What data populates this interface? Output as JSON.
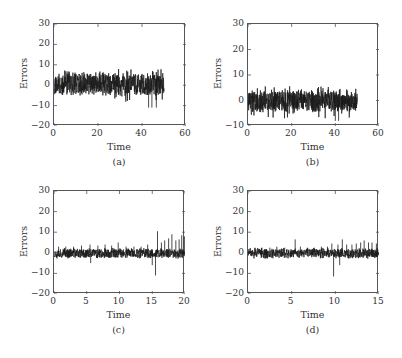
{
  "chart_data": [
    {
      "id": "a",
      "type": "line",
      "caption": "(a)",
      "xlabel": "Time",
      "ylabel": "Errors",
      "xlim": [
        0,
        60
      ],
      "ylim": [
        -20,
        30
      ],
      "xticks": [
        "0",
        "20",
        "40",
        "60"
      ],
      "yticks": [
        "30",
        "20",
        "10",
        "0",
        "−10",
        "−20"
      ],
      "data_range_x": [
        0,
        50
      ],
      "description": "Dense noise signal around 0, mostly between -5 and +7, occasional dips to about -11 near t=43-47",
      "envelope": {
        "upper": 7,
        "lower": -6,
        "min_spike": -11,
        "max_spike": 8
      },
      "seed": 11
    },
    {
      "id": "b",
      "type": "line",
      "caption": "(b)",
      "xlabel": "Time",
      "ylabel": "Errors",
      "xlim": [
        0,
        60
      ],
      "ylim": [
        -10,
        30
      ],
      "xticks": [
        "0",
        "20",
        "40",
        "60"
      ],
      "yticks": [
        "30",
        "20",
        "10",
        "0",
        "−10"
      ],
      "data_range_x": [
        0,
        50
      ],
      "description": "Dense noise signal around 0, mostly between -5 and +5, max about +6, min about -8",
      "envelope": {
        "upper": 5,
        "lower": -5,
        "min_spike": -8,
        "max_spike": 6
      },
      "seed": 23
    },
    {
      "id": "c",
      "type": "line",
      "caption": "(c)",
      "xlabel": "Time",
      "ylabel": "Errors",
      "xlim": [
        0,
        20
      ],
      "ylim": [
        -20,
        30
      ],
      "xticks": [
        "0",
        "5",
        "10",
        "15",
        "20"
      ],
      "yticks": [
        "30",
        "20",
        "10",
        "0",
        "−10",
        "−20"
      ],
      "data_range_x": [
        0,
        20
      ],
      "description": "Noise band about -3 to +3 with small periodic spikes; after t=15 larger spikes up to ~10 and a dip to ~-11 at t=15.5",
      "envelope": {
        "upper": 2.5,
        "lower": -3,
        "min_spike": -11,
        "max_spike": 10
      },
      "spikes": [
        {
          "x": 0.7,
          "y": 3
        },
        {
          "x": 1.8,
          "y": 3
        },
        {
          "x": 3.0,
          "y": 3
        },
        {
          "x": 4.2,
          "y": 3.5
        },
        {
          "x": 5.5,
          "y": 4
        },
        {
          "x": 5.6,
          "y": -5
        },
        {
          "x": 6.7,
          "y": 3.5
        },
        {
          "x": 7.8,
          "y": 4
        },
        {
          "x": 8.8,
          "y": 3.5
        },
        {
          "x": 9.8,
          "y": 5
        },
        {
          "x": 11,
          "y": 3
        },
        {
          "x": 12.2,
          "y": 3
        },
        {
          "x": 13.3,
          "y": 3
        },
        {
          "x": 14.3,
          "y": 4
        },
        {
          "x": 15.0,
          "y": -6
        },
        {
          "x": 15.5,
          "y": -11
        },
        {
          "x": 15.8,
          "y": 10.5
        },
        {
          "x": 16.4,
          "y": 5
        },
        {
          "x": 16.9,
          "y": 6
        },
        {
          "x": 17.5,
          "y": 7
        },
        {
          "x": 18.0,
          "y": 9
        },
        {
          "x": 18.6,
          "y": 6
        },
        {
          "x": 19.1,
          "y": 6.5
        },
        {
          "x": 19.5,
          "y": 8.5
        },
        {
          "x": 19.9,
          "y": 8
        }
      ],
      "seed": 37
    },
    {
      "id": "d",
      "type": "line",
      "caption": "(d)",
      "xlabel": "Time",
      "ylabel": "Errors",
      "xlim": [
        0,
        15
      ],
      "ylim": [
        -20,
        30
      ],
      "xticks": [
        "0",
        "5",
        "10",
        "15"
      ],
      "yticks": [
        "30",
        "20",
        "10",
        "0",
        "−10",
        "−20"
      ],
      "data_range_x": [
        0,
        15
      ],
      "description": "Noise band about -3 to +3 with regular small spikes; spike to ~6.5 at t=5.4, dip to ~-11.5 at t=9.8, growing spikes up to ~6 near t=13-15",
      "envelope": {
        "upper": 2.5,
        "lower": -3,
        "min_spike": -11.5,
        "max_spike": 6.5
      },
      "spikes": [
        {
          "x": 0.8,
          "y": 2.5
        },
        {
          "x": 1.6,
          "y": 2.5
        },
        {
          "x": 2.5,
          "y": 2.5
        },
        {
          "x": 3.3,
          "y": 3
        },
        {
          "x": 4.2,
          "y": 2.5
        },
        {
          "x": 5.4,
          "y": 6.5
        },
        {
          "x": 6.0,
          "y": 3
        },
        {
          "x": 6.8,
          "y": 2.5
        },
        {
          "x": 7.6,
          "y": 2.5
        },
        {
          "x": 8.4,
          "y": 3
        },
        {
          "x": 9.1,
          "y": 3
        },
        {
          "x": 9.6,
          "y": 4.5
        },
        {
          "x": 9.8,
          "y": -11.5
        },
        {
          "x": 10.3,
          "y": 4
        },
        {
          "x": 10.5,
          "y": -6
        },
        {
          "x": 10.8,
          "y": 6.5
        },
        {
          "x": 11.3,
          "y": 4
        },
        {
          "x": 11.9,
          "y": 4
        },
        {
          "x": 12.4,
          "y": 4.5
        },
        {
          "x": 12.9,
          "y": 5
        },
        {
          "x": 13.3,
          "y": 6
        },
        {
          "x": 13.8,
          "y": 5
        },
        {
          "x": 14.2,
          "y": 5
        },
        {
          "x": 14.7,
          "y": 4.5
        }
      ],
      "seed": 51
    }
  ],
  "panels": {
    "a": {
      "caption": "(a)",
      "xlabel": "Time",
      "ylabel": "Errors"
    },
    "b": {
      "caption": "(b)",
      "xlabel": "Time",
      "ylabel": "Errors"
    },
    "c": {
      "caption": "(c)",
      "xlabel": "Time",
      "ylabel": "Errors"
    },
    "d": {
      "caption": "(d)",
      "xlabel": "Time",
      "ylabel": "Errors"
    }
  }
}
